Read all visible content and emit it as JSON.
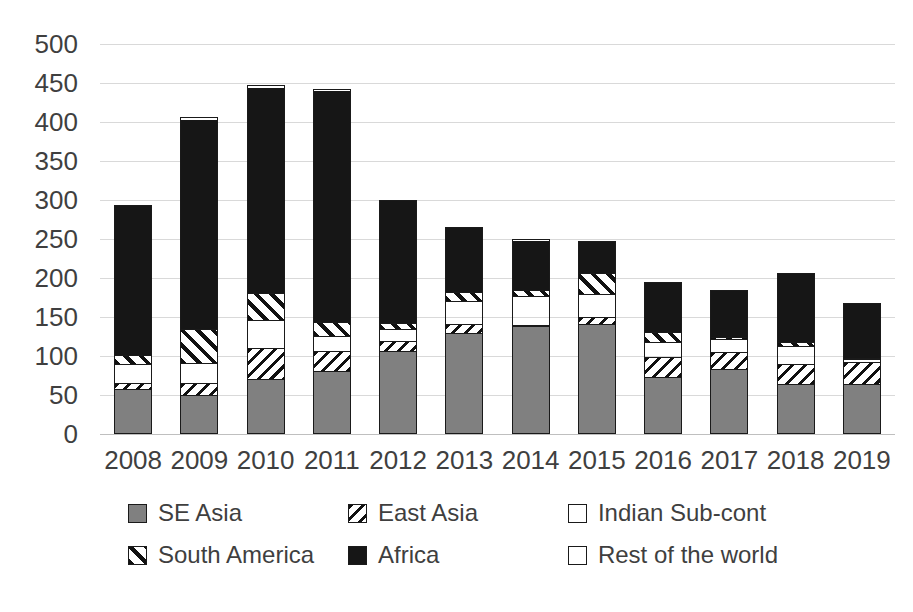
{
  "chart_data": {
    "type": "bar",
    "subtype": "stacked-column",
    "title": "",
    "xlabel": "",
    "ylabel": "",
    "ylim": [
      0,
      500
    ],
    "ytick_step": 50,
    "yticks": [
      "500",
      "450",
      "400",
      "350",
      "300",
      "250",
      "200",
      "150",
      "100",
      "50",
      "0"
    ],
    "grid": true,
    "legend_position": "bottom",
    "categories": [
      "2008",
      "2009",
      "2010",
      "2011",
      "2012",
      "2013",
      "2014",
      "2015",
      "2016",
      "2017",
      "2018",
      "2019"
    ],
    "series": [
      {
        "name": "SE Asia",
        "key": "se-asia",
        "color": "#808080",
        "pattern": "solid",
        "values": [
          56,
          49,
          69,
          80,
          105,
          128,
          137,
          140,
          72,
          82,
          63,
          63
        ]
      },
      {
        "name": "East Asia",
        "key": "east-asia",
        "color": "#ffffff",
        "pattern": "diagonal-hatch-right",
        "values": [
          10,
          16,
          41,
          26,
          14,
          13,
          3,
          10,
          27,
          23,
          27,
          29
        ]
      },
      {
        "name": "Indian Sub-cont",
        "key": "indian-sub-cont",
        "color": "#d6d6d6",
        "pattern": "solid",
        "values": [
          22,
          25,
          35,
          19,
          14,
          28,
          36,
          28,
          18,
          15,
          22,
          2
        ]
      },
      {
        "name": "South America",
        "key": "south-america",
        "color": "#ffffff",
        "pattern": "diagonal-hatch-left",
        "values": [
          13,
          45,
          36,
          19,
          10,
          13,
          9,
          29,
          14,
          4,
          6,
          3
        ]
      },
      {
        "name": "Africa",
        "key": "africa",
        "color": "#161616",
        "pattern": "solid",
        "values": [
          193,
          267,
          263,
          296,
          157,
          83,
          62,
          40,
          64,
          61,
          88,
          71
        ]
      },
      {
        "name": "Rest of the world",
        "key": "rest-of-the-world",
        "color": "#ffffff",
        "pattern": "solid",
        "values": [
          0,
          5,
          4,
          2,
          0,
          0,
          2,
          0,
          0,
          0,
          0,
          0
        ]
      }
    ],
    "totals": [
      294,
      407,
      448,
      442,
      300,
      265,
      249,
      247,
      195,
      185,
      206,
      168
    ]
  },
  "legend": {
    "items": [
      {
        "label": "SE Asia",
        "key": "se-asia"
      },
      {
        "label": "East Asia",
        "key": "east-asia"
      },
      {
        "label": "Indian Sub-cont",
        "key": "indian-sub-cont"
      },
      {
        "label": "South America",
        "key": "south-america"
      },
      {
        "label": "Africa",
        "key": "africa"
      },
      {
        "label": "Rest of the world",
        "key": "rest-of-the-world"
      }
    ]
  }
}
